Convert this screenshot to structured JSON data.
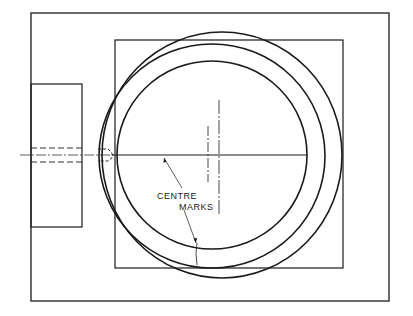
{
  "diagram": {
    "labels": {
      "centre_line1": "CENTRE",
      "centre_line2": "MARKS"
    },
    "colors": {
      "ink": "#1a1a1a",
      "background": "#ffffff"
    }
  }
}
